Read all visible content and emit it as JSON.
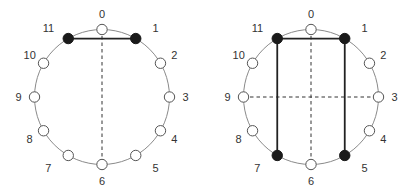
{
  "colors": {
    "circle_stroke": "#8a8a8a",
    "node_open_fill": "#ffffff",
    "node_open_stroke": "#555555",
    "node_filled": "#1a1a1a",
    "solid_edge": "#222222",
    "dashed_edge": "#333333",
    "label": "#333333"
  },
  "diagrams": [
    {
      "id": "left",
      "center": [
        102,
        97
      ],
      "radius": 67.5,
      "nodes": [
        {
          "label": "0",
          "filled": false
        },
        {
          "label": "1",
          "filled": true
        },
        {
          "label": "2",
          "filled": false
        },
        {
          "label": "3",
          "filled": false
        },
        {
          "label": "4",
          "filled": false
        },
        {
          "label": "5",
          "filled": false
        },
        {
          "label": "6",
          "filled": false
        },
        {
          "label": "7",
          "filled": false
        },
        {
          "label": "8",
          "filled": false
        },
        {
          "label": "9",
          "filled": false
        },
        {
          "label": "10",
          "filled": false
        },
        {
          "label": "11",
          "filled": true
        }
      ],
      "solid_edges": [
        [
          11,
          1
        ]
      ],
      "dashed_edges": [
        [
          0,
          6
        ]
      ]
    },
    {
      "id": "right",
      "center": [
        311,
        97
      ],
      "radius": 67.5,
      "nodes": [
        {
          "label": "0",
          "filled": false
        },
        {
          "label": "1",
          "filled": true
        },
        {
          "label": "2",
          "filled": false
        },
        {
          "label": "3",
          "filled": false
        },
        {
          "label": "4",
          "filled": false
        },
        {
          "label": "5",
          "filled": true
        },
        {
          "label": "6",
          "filled": false
        },
        {
          "label": "7",
          "filled": true
        },
        {
          "label": "8",
          "filled": false
        },
        {
          "label": "9",
          "filled": false
        },
        {
          "label": "10",
          "filled": false
        },
        {
          "label": "11",
          "filled": true
        }
      ],
      "solid_edges": [
        [
          11,
          1
        ],
        [
          1,
          5
        ],
        [
          11,
          7
        ]
      ],
      "dashed_edges": [
        [
          0,
          6
        ],
        [
          9,
          3
        ]
      ]
    }
  ]
}
